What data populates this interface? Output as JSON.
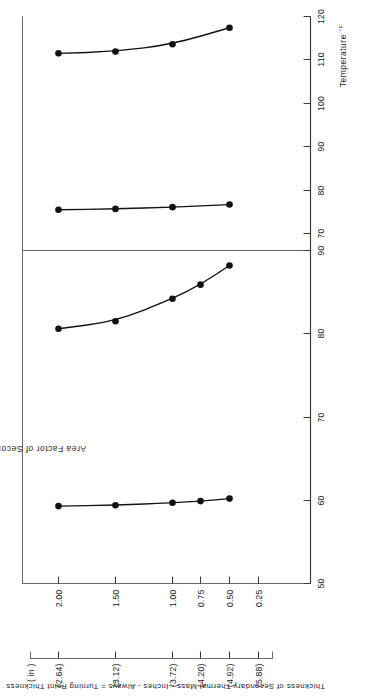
{
  "figure": {
    "orientation_note": "page-rotated-90",
    "background": "#ffffff",
    "ink": "#141414"
  },
  "axes": {
    "x_title": "Temperature",
    "x_unit": "°F",
    "y_title": "Area Factor of Secondary Thermal Mass",
    "y2_title": "Thickness of Secondary Thermal Mass - Inches - Always = Turning Point Thickness",
    "y2_header": "( in )"
  },
  "panels": [
    {
      "id": "left-panel",
      "x_ticks": [
        "50",
        "60",
        "70",
        "80",
        "90"
      ],
      "x_values": [
        50,
        60,
        70,
        80,
        90
      ]
    },
    {
      "id": "right-panel",
      "x_ticks": [
        "70",
        "80",
        "90",
        "100",
        "110",
        "120"
      ],
      "x_values": [
        70,
        80,
        90,
        100,
        110,
        120
      ]
    }
  ],
  "y_ticks": [
    {
      "area_factor": "2.00",
      "thickness": "(2.64)"
    },
    {
      "area_factor": "1.50",
      "thickness": "(3.12)"
    },
    {
      "area_factor": "1.00",
      "thickness": "(3.72)"
    },
    {
      "area_factor": "0.75",
      "thickness": "(4.20)"
    },
    {
      "area_factor": "0.50",
      "thickness": "(4.92)"
    },
    {
      "area_factor": "0.25",
      "thickness": "(5.88)"
    }
  ],
  "chart_data": {
    "type": "line",
    "title": "",
    "xlabel": "Temperature °F",
    "ylabel": "Area Factor of Secondary Thermal Mass",
    "y2label": "Thickness of Secondary Thermal Mass - Inches - Always = Turning Point Thickness",
    "grid": false,
    "legend": "none",
    "panels": [
      {
        "name": "left-panel",
        "xlim": [
          50,
          90
        ],
        "xticks": [
          50,
          60,
          70,
          80,
          90
        ],
        "series": [
          {
            "name": "lower-temperature-curve-left",
            "x": [
              59.3,
              59.4,
              59.7,
              59.9,
              60.2
            ],
            "y_area_factor": [
              2.0,
              1.5,
              1.0,
              0.75,
              0.5
            ]
          },
          {
            "name": "upper-temperature-curve-left",
            "x": [
              80.6,
              81.5,
              84.2,
              85.9,
              88.2
            ],
            "y_area_factor": [
              2.0,
              1.5,
              1.0,
              0.75,
              0.5
            ]
          }
        ]
      },
      {
        "name": "right-panel",
        "xlim": [
          66,
          120
        ],
        "xticks": [
          70,
          80,
          90,
          100,
          110,
          120
        ],
        "series": [
          {
            "name": "lower-temperature-curve-right",
            "x": [
              75.4,
              75.6,
              76.0,
              76.6
            ],
            "y_area_factor": [
              2.0,
              1.5,
              1.0,
              0.5
            ]
          },
          {
            "name": "upper-temperature-curve-right",
            "x": [
              111.5,
              111.9,
              113.6,
              117.4
            ],
            "y_area_factor": [
              2.0,
              1.5,
              1.0,
              0.5
            ]
          }
        ]
      }
    ],
    "y_categories": [
      "2.00",
      "1.50",
      "1.00",
      "0.75",
      "0.50",
      "0.25"
    ],
    "y_secondary_categories": [
      "(2.64)",
      "(3.12)",
      "(3.72)",
      "(4.20)",
      "(4.92)",
      "(5.88)"
    ]
  }
}
